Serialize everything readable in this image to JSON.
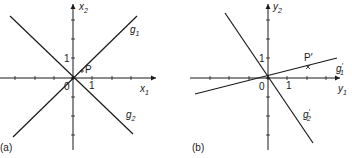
{
  "panels": [
    {
      "id": "a",
      "caption": "(a)",
      "origin_label": "0",
      "x_axis": {
        "name": "x",
        "sub": "1",
        "tick_label": "1"
      },
      "y_axis": {
        "name": "x",
        "sub": "2",
        "tick_label": "1"
      },
      "lines": [
        {
          "name": "g",
          "sub": "1",
          "prime": "",
          "slope": 1
        },
        {
          "name": "g",
          "sub": "2",
          "prime": "",
          "slope": -1
        }
      ],
      "point": {
        "label": "P",
        "marker": "+",
        "x": 0.3,
        "y": 0.3
      }
    },
    {
      "id": "b",
      "caption": "(b)",
      "origin_label": "0",
      "x_axis": {
        "name": "y",
        "sub": "1",
        "tick_label": "1"
      },
      "y_axis": {
        "name": "y",
        "sub": "2",
        "tick_label": "1"
      },
      "lines": [
        {
          "name": "g",
          "sub": "1",
          "prime": "′",
          "slope": 0.333
        },
        {
          "name": "g",
          "sub": "2",
          "prime": "′",
          "slope": -1.8
        }
      ],
      "point": {
        "label": "P′",
        "marker": "×",
        "x": 1.5,
        "y": 0.5
      }
    }
  ],
  "colors": {
    "ink": "#1a1a1a",
    "background": "#ffffff"
  }
}
